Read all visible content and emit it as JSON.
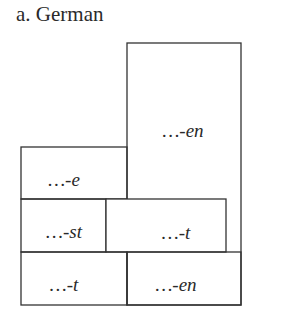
{
  "title": "a.  German",
  "cells": [
    {
      "id": "top-right",
      "label": "…-en"
    },
    {
      "id": "e",
      "label": "…-e"
    },
    {
      "id": "st",
      "label": "…-st"
    },
    {
      "id": "middle-t",
      "label": "…-t"
    },
    {
      "id": "bottom-left-t",
      "label": "…-t"
    },
    {
      "id": "bottom-right-en",
      "label": "…-en"
    }
  ]
}
